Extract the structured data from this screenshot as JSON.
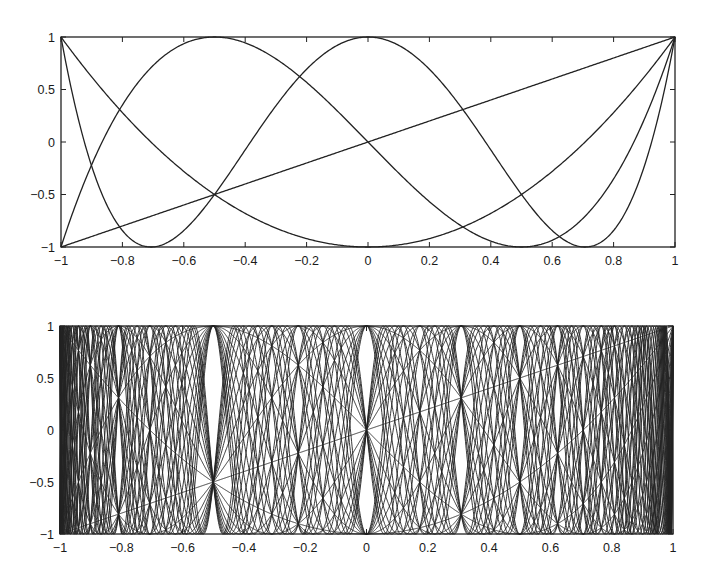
{
  "chart_data": [
    {
      "type": "line",
      "title": "",
      "description": "Chebyshev polynomials T_n(x) = cos(n arccos x), n = 1..4",
      "xlabel": "",
      "ylabel": "",
      "xlim": [
        -1,
        1
      ],
      "ylim": [
        -1,
        1
      ],
      "grid": false,
      "legend": null,
      "xticks": [
        -1,
        -0.8,
        -0.6,
        -0.4,
        -0.2,
        0,
        0.2,
        0.4,
        0.6,
        0.8,
        1
      ],
      "xtick_labels": [
        "−1",
        "−0.8",
        "−0.6",
        "−0.4",
        "−0.2",
        "0",
        "0.2",
        "0.4",
        "0.6",
        "0.8",
        "1"
      ],
      "yticks": [
        1,
        0.5,
        0,
        -0.5,
        -1
      ],
      "ytick_labels": [
        "1",
        "0.5",
        "0",
        "−0.5",
        "−1"
      ],
      "degrees": [
        1,
        2,
        3,
        4
      ],
      "series": [
        {
          "name": "T1",
          "x": [
            -1,
            -0.5,
            0,
            0.5,
            1
          ],
          "values": [
            -1,
            -0.5,
            0,
            0.5,
            1
          ]
        },
        {
          "name": "T2",
          "x": [
            -1,
            -0.5,
            0,
            0.5,
            1
          ],
          "values": [
            1,
            -0.5,
            -1,
            -0.5,
            1
          ]
        },
        {
          "name": "T3",
          "x": [
            -1,
            -0.5,
            0,
            0.5,
            1
          ],
          "values": [
            -1,
            1,
            0,
            -1,
            1
          ]
        },
        {
          "name": "T4",
          "x": [
            -1,
            -0.5,
            0,
            0.5,
            1
          ],
          "values": [
            1,
            -0.5,
            1,
            -0.5,
            1
          ]
        }
      ],
      "frame_px": {
        "left": 61,
        "top": 37,
        "right": 675,
        "bottom": 247
      }
    },
    {
      "type": "line",
      "title": "",
      "description": "Chebyshev polynomials T_n(x), n = 1..30, superimposed",
      "xlabel": "",
      "ylabel": "",
      "xlim": [
        -1,
        1
      ],
      "ylim": [
        -1,
        1
      ],
      "grid": false,
      "legend": null,
      "xticks": [
        -1,
        -0.8,
        -0.6,
        -0.4,
        -0.2,
        0,
        0.2,
        0.4,
        0.6,
        0.8,
        1
      ],
      "xtick_labels": [
        "−1",
        "−0.8",
        "−0.6",
        "−0.4",
        "−0.2",
        "0",
        "0.2",
        "0.4",
        "0.6",
        "0.8",
        "1"
      ],
      "yticks": [
        1,
        0.5,
        0,
        -0.5,
        -1
      ],
      "ytick_labels": [
        "1",
        "0.5",
        "0",
        "−0.5",
        "−1"
      ],
      "degrees": [
        1,
        2,
        3,
        4,
        5,
        6,
        7,
        8,
        9,
        10,
        11,
        12,
        13,
        14,
        15,
        16,
        17,
        18,
        19,
        20,
        21,
        22,
        23,
        24,
        25,
        26,
        27,
        28,
        29,
        30
      ],
      "frame_px": {
        "left": 60,
        "top": 326,
        "right": 673,
        "bottom": 534
      }
    }
  ],
  "style": {
    "line_color": "#222222",
    "axis_color": "#222222",
    "background": "#ffffff"
  }
}
